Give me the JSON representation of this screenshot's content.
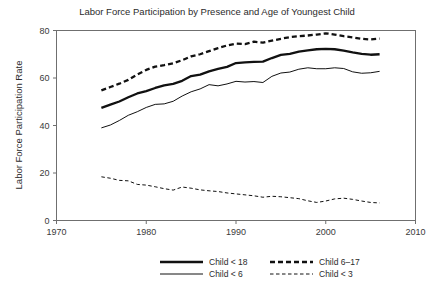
{
  "chart_data": {
    "type": "line",
    "title": "Labor Force Participation by Presence and Age of Youngest Child",
    "xlabel": "",
    "ylabel": "Labor Force Participation Rate",
    "xlim": [
      1970,
      2010
    ],
    "ylim": [
      0,
      80
    ],
    "xticks": [
      1970,
      1980,
      1990,
      2000,
      2010
    ],
    "yticks": [
      0,
      20,
      40,
      60,
      80
    ],
    "grid": false,
    "legend_position": "bottom",
    "x": [
      1975,
      1976,
      1977,
      1978,
      1979,
      1980,
      1981,
      1982,
      1983,
      1984,
      1985,
      1986,
      1987,
      1988,
      1989,
      1990,
      1991,
      1992,
      1993,
      1994,
      1995,
      1996,
      1997,
      1998,
      1999,
      2000,
      2001,
      2002,
      2003,
      2004,
      2005,
      2006
    ],
    "series": [
      {
        "name": "Child < 18",
        "style": "thick-solid",
        "values": [
          47.4,
          48.8,
          50.1,
          51.9,
          53.5,
          54.5,
          55.8,
          56.9,
          57.5,
          58.8,
          60.8,
          61.4,
          62.8,
          63.8,
          64.7,
          66.3,
          66.6,
          66.8,
          66.9,
          68.4,
          69.7,
          70.2,
          71.1,
          71.6,
          72.1,
          72.3,
          72.1,
          71.5,
          70.8,
          70.2,
          69.8,
          70.0
        ]
      },
      {
        "name": "Child  6–17",
        "style": "thick-dashed",
        "values": [
          54.8,
          56.2,
          57.6,
          59.2,
          61.5,
          63.4,
          64.8,
          65.4,
          66.2,
          67.5,
          69.1,
          70.0,
          71.3,
          72.6,
          73.7,
          74.5,
          74.3,
          75.3,
          74.9,
          75.7,
          76.5,
          77.2,
          77.6,
          77.9,
          78.3,
          78.8,
          78.3,
          77.6,
          77.1,
          76.5,
          76.2,
          76.6
        ]
      },
      {
        "name": "Child < 6",
        "style": "thin-solid",
        "values": [
          39.0,
          40.2,
          42.1,
          44.3,
          45.8,
          47.6,
          48.9,
          49.1,
          50.2,
          52.4,
          54.2,
          55.4,
          57.2,
          56.7,
          57.5,
          58.6,
          58.3,
          58.5,
          58.1,
          60.7,
          62.1,
          62.5,
          63.7,
          64.3,
          63.9,
          63.9,
          64.3,
          64.0,
          62.6,
          62.0,
          62.2,
          62.8
        ]
      },
      {
        "name": "Child < 3",
        "style": "thin-dashed",
        "values": [
          18.4,
          17.8,
          16.9,
          16.7,
          15.2,
          14.9,
          14.2,
          13.4,
          12.8,
          14.1,
          13.6,
          12.9,
          12.5,
          12.2,
          11.6,
          11.2,
          10.8,
          10.4,
          9.8,
          10.2,
          10.0,
          9.6,
          9.2,
          8.3,
          7.6,
          8.2,
          9.1,
          9.4,
          8.9,
          8.2,
          7.6,
          7.4
        ]
      }
    ]
  },
  "legend": {
    "entries": [
      {
        "label": "Child < 18",
        "style": "thick-solid"
      },
      {
        "label": "Child  6–17",
        "style": "thick-dashed"
      },
      {
        "label": "Child < 6",
        "style": "thin-solid"
      },
      {
        "label": "Child < 3",
        "style": "thin-dashed"
      }
    ]
  },
  "colors": {
    "line": "#111111",
    "frame": "#6f6f6f",
    "text": "#2b2b2b",
    "background": "#ffffff"
  }
}
